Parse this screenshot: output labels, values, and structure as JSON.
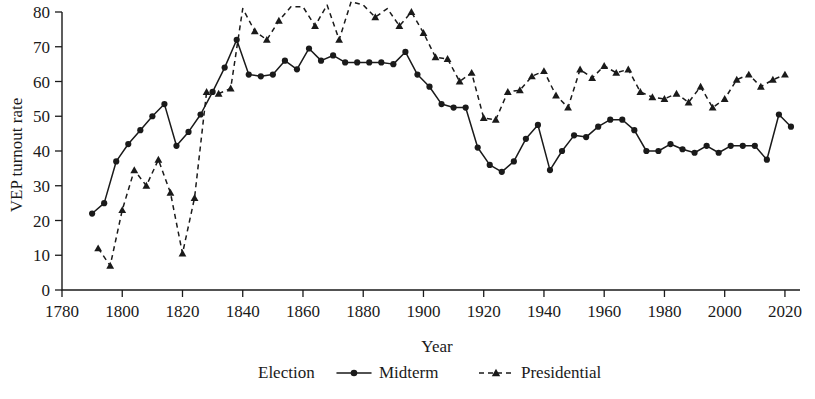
{
  "chart_data": {
    "type": "line",
    "title": "",
    "xlabel": "Year",
    "ylabel": "VEP turnout rate",
    "xlim": [
      1780,
      2025
    ],
    "ylim": [
      0,
      80
    ],
    "yclip": 80,
    "grid": false,
    "legend_position": "bottom",
    "legend_title": "Election",
    "xticks": [
      1780,
      1800,
      1820,
      1840,
      1860,
      1880,
      1900,
      1920,
      1940,
      1960,
      1980,
      2000,
      2020
    ],
    "xticklabels": [
      "1780",
      "1800",
      "1820",
      "1840",
      "1860",
      "1880",
      "1900",
      "1920",
      "1940",
      "1960",
      "1980",
      "2000",
      "2020"
    ],
    "yticks": [
      0,
      10,
      20,
      30,
      40,
      50,
      60,
      70,
      80
    ],
    "yticklabels": [
      "0",
      "10",
      "20",
      "30",
      "40",
      "50",
      "60",
      "70",
      "80"
    ],
    "series": [
      {
        "name": "Midterm",
        "marker": "circle",
        "linestyle": "solid",
        "color": "#1a1a1a",
        "x": [
          1790,
          1794,
          1798,
          1802,
          1806,
          1810,
          1814,
          1818,
          1822,
          1826,
          1830,
          1834,
          1838,
          1842,
          1846,
          1850,
          1854,
          1858,
          1862,
          1866,
          1870,
          1874,
          1878,
          1882,
          1886,
          1890,
          1894,
          1898,
          1902,
          1906,
          1910,
          1914,
          1918,
          1922,
          1926,
          1930,
          1934,
          1938,
          1942,
          1946,
          1950,
          1954,
          1958,
          1962,
          1966,
          1970,
          1974,
          1978,
          1982,
          1986,
          1990,
          1994,
          1998,
          2002,
          2006,
          2010,
          2014,
          2018,
          2022
        ],
        "y": [
          22,
          25,
          37,
          42,
          46,
          50,
          53.5,
          41.5,
          45.5,
          50.5,
          57,
          64,
          72,
          62,
          61.5,
          62,
          66,
          63.5,
          69.5,
          66,
          67.5,
          65.5,
          65.5,
          65.5,
          65.5,
          65,
          68.5,
          62,
          58.5,
          53.5,
          52.5,
          52.5,
          41,
          36,
          34,
          37,
          43.5,
          47.5,
          34.5,
          40,
          44.5,
          44,
          47,
          49,
          49,
          46,
          40,
          40,
          42,
          40.5,
          39.5,
          41.5,
          39.5,
          41.5,
          41.5,
          41.5,
          37.5,
          50.5,
          47
        ]
      },
      {
        "name": "Presidential",
        "marker": "triangle",
        "linestyle": "dashed",
        "color": "#1a1a1a",
        "x": [
          1792,
          1796,
          1800,
          1804,
          1808,
          1812,
          1816,
          1820,
          1824,
          1828,
          1832,
          1836,
          1840,
          1844,
          1848,
          1852,
          1856,
          1860,
          1864,
          1868,
          1872,
          1876,
          1880,
          1884,
          1888,
          1892,
          1896,
          1900,
          1904,
          1908,
          1912,
          1916,
          1920,
          1924,
          1928,
          1932,
          1936,
          1940,
          1944,
          1948,
          1952,
          1956,
          1960,
          1964,
          1968,
          1972,
          1976,
          1980,
          1984,
          1988,
          1992,
          1996,
          2000,
          2004,
          2008,
          2012,
          2016,
          2020
        ],
        "y": [
          12,
          7,
          23,
          34.5,
          30,
          37.5,
          28,
          10.5,
          26.5,
          57,
          56.5,
          58,
          81,
          74.5,
          72,
          77.5,
          81.5,
          81.5,
          76,
          82,
          72,
          83,
          82,
          78.5,
          81,
          76,
          80,
          74,
          67,
          66.5,
          60,
          62.5,
          49.5,
          49,
          57,
          57.5,
          61.5,
          63,
          56,
          52.5,
          63.5,
          61,
          64.5,
          62.5,
          63.5,
          57,
          55.5,
          55,
          56.5,
          54,
          58.5,
          52.5,
          55,
          60.5,
          62,
          58.5,
          60.5,
          62
        ]
      }
    ]
  }
}
